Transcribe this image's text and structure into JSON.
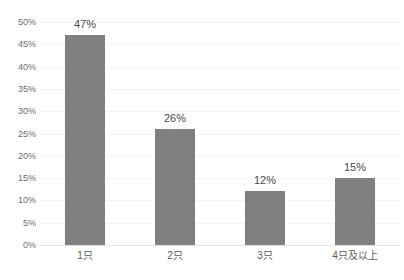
{
  "chart_data": {
    "type": "bar",
    "title": "",
    "title_note": "title cropped off at top edge of screenshot, not legible",
    "categories": [
      "1只",
      "2只",
      "3只",
      "4只及以上"
    ],
    "values": [
      47,
      26,
      12,
      15
    ],
    "data_labels": [
      "47%",
      "26%",
      "12%",
      "15%"
    ],
    "xlabel": "",
    "ylabel": "",
    "ylim": [
      0,
      50
    ],
    "ytick_step": 5,
    "ytick_labels": [
      "0%",
      "5%",
      "10%",
      "15%",
      "20%",
      "25%",
      "30%",
      "35%",
      "40%",
      "45%",
      "50%"
    ],
    "ytick_values": [
      0,
      5,
      10,
      15,
      20,
      25,
      30,
      35,
      40,
      45,
      50
    ],
    "grid": true,
    "grid_axis": "y",
    "legend": false,
    "legend_position": "none",
    "series": [
      {
        "name": "",
        "values": [
          47,
          26,
          12,
          15
        ]
      }
    ]
  },
  "colors": {
    "bar": "#808080",
    "gridline": "#f2f2f2",
    "baseline": "#e4e4e4",
    "tick_text": "#6b6b6b",
    "label_text": "#4a4a4a",
    "background": "#ffffff"
  }
}
